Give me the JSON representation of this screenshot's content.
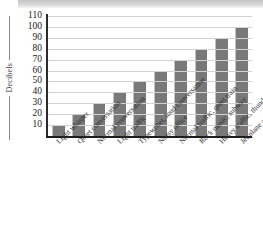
{
  "chart_data": {
    "type": "bar",
    "title": "",
    "xlabel": "",
    "ylabel": "Decibels",
    "ylim": [
      0,
      110
    ],
    "yticks": [
      10,
      20,
      30,
      40,
      50,
      60,
      70,
      80,
      90,
      100,
      110
    ],
    "grid": true,
    "legend": null,
    "categories": [
      "Light whisper",
      "Quiet conversation",
      "Normal conversation",
      "Light traffic",
      "Typewriter, loud conversation",
      "Noisy office",
      "Normal traffic, quiet train",
      "Rock music, subway",
      "Heavy traffic, thunder",
      "Jet plane at takeoff"
    ],
    "values": [
      10,
      20,
      30,
      40,
      50,
      60,
      70,
      80,
      90,
      100
    ],
    "bar_color": "#797979",
    "gridline_color": "#d2d2d2",
    "axis_color": "#1d1d1d"
  },
  "axis": {
    "y_title": "Decibels"
  }
}
